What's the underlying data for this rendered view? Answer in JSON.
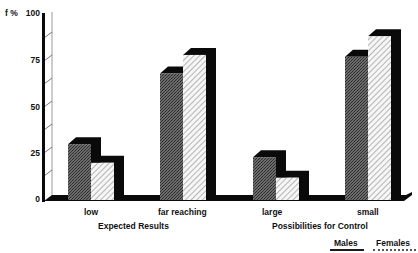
{
  "chart_data": {
    "type": "bar",
    "style": "3d-grouped",
    "ylabel": "f %",
    "ylim": [
      0,
      100
    ],
    "yticks": [
      0,
      25,
      50,
      75,
      100
    ],
    "categories": [
      "low",
      "far reaching",
      "large",
      "small"
    ],
    "groups": [
      {
        "label": "Expected Results",
        "categories": [
          "low",
          "far reaching"
        ]
      },
      {
        "label": "Possibilities for Control",
        "categories": [
          "large",
          "small"
        ]
      }
    ],
    "series": [
      {
        "name": "Males",
        "pattern": "dark-stipple",
        "values": [
          30,
          68,
          23,
          77
        ]
      },
      {
        "name": "Females",
        "pattern": "diagonal-hatch",
        "values": [
          20,
          78,
          12,
          88
        ]
      }
    ],
    "legend_position": "bottom-right",
    "grid": false
  },
  "axis": {
    "ylabel": "f %",
    "ticks": [
      "100",
      "75",
      "50",
      "25",
      "0"
    ]
  },
  "xlabels": {
    "low": "low",
    "far_reaching": "far reaching",
    "large": "large",
    "small": "small"
  },
  "group_titles": {
    "expected": "Expected Results",
    "control": "Possibilities for Control"
  },
  "legend": {
    "males": "Males",
    "females": "Females"
  },
  "colors": {
    "males_fill": "#5a5a5a",
    "females_fill": "#f4f4f4",
    "shadow": "#0a0a0a",
    "axis": "#0a0a0a"
  }
}
